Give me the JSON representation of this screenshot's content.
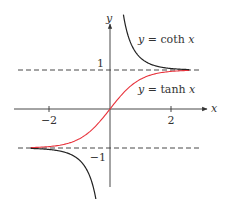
{
  "chart_data": {
    "type": "line",
    "title": "",
    "xlabel": "x",
    "ylabel": "y",
    "xlim": [
      -3.6,
      3.3
    ],
    "ylim": [
      -2.1,
      2.7
    ],
    "grid": false,
    "x_ticks": [
      {
        "value": -2,
        "label": "−2"
      },
      {
        "value": 2,
        "label": "2"
      }
    ],
    "y_ticks": [
      {
        "value": 1,
        "label": "1"
      },
      {
        "value": -1,
        "label": "−1"
      }
    ],
    "asymptotes": [
      {
        "type": "horizontal",
        "y": 1,
        "style": "dashed"
      },
      {
        "type": "horizontal",
        "y": -1,
        "style": "dashed"
      }
    ],
    "series": [
      {
        "name": "y = tanh x",
        "function": "tanh",
        "color": "#e8333c",
        "domain": [
          -2.6,
          2.6
        ]
      },
      {
        "name": "y = coth x",
        "function": "coth",
        "color": "#222222",
        "domain_pos": [
          0.44,
          2.6
        ],
        "domain_neg": [
          -2.6,
          -0.44
        ]
      }
    ],
    "annotations": [
      {
        "text_prefix": "y",
        "text_eq": " = coth ",
        "text_var": "x",
        "x": 0.95,
        "y": 2.2
      },
      {
        "text_prefix": "y",
        "text_eq": " = tanh ",
        "text_var": "x",
        "x": 0.95,
        "y": 0.55
      }
    ]
  },
  "labels": {
    "x_axis": "x",
    "y_axis": "y",
    "tick_neg2": "−2",
    "tick_pos2": "2",
    "tick_pos1": "1",
    "tick_neg1": "−1",
    "coth_label_var": "y",
    "coth_label_eq": " = coth ",
    "coth_label_x": "x",
    "tanh_label_var": "y",
    "tanh_label_eq": " = tanh ",
    "tanh_label_x": "x"
  }
}
